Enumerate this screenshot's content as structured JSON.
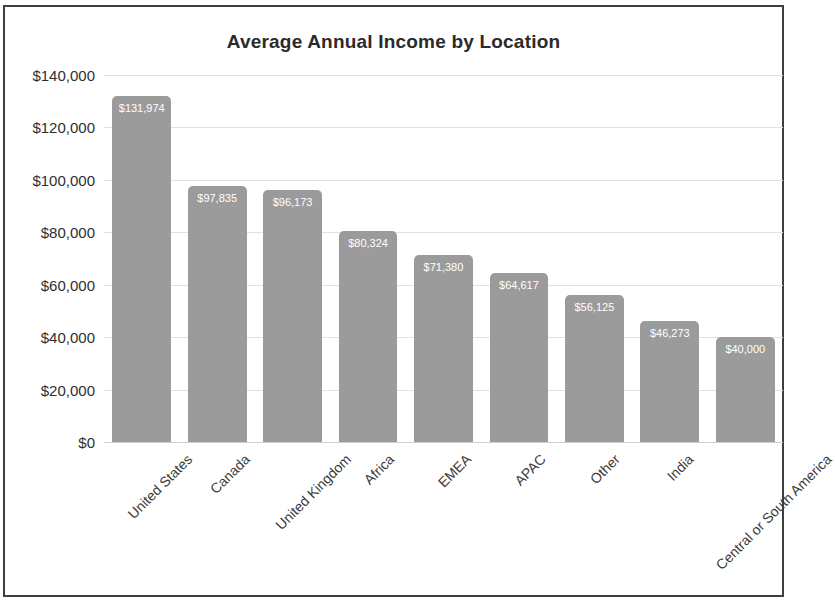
{
  "chart_data": {
    "type": "bar",
    "title": "Average Annual Income by Location",
    "xlabel": "",
    "ylabel": "",
    "ylim": [
      0,
      140000
    ],
    "grid": true,
    "legend": "none",
    "categories": [
      "United States",
      "Canada",
      "United Kingdom",
      "Africa",
      "EMEA",
      "APAC",
      "Other",
      "India",
      "Central or South America"
    ],
    "values": [
      131974,
      97835,
      96173,
      80324,
      71380,
      64617,
      56125,
      46273,
      40000
    ],
    "data_labels": [
      "$131,974",
      "$97,835",
      "$96,173",
      "$80,324",
      "$71,380",
      "$64,617",
      "$56,125",
      "$46,273",
      "$40,000"
    ],
    "y_ticks": [
      140000,
      120000,
      100000,
      80000,
      60000,
      40000,
      20000,
      0
    ],
    "y_tick_labels": [
      "$140,000",
      "$120,000",
      "$100,000",
      "$80,000",
      "$60,000",
      "$40,000",
      "$20,000",
      "$0"
    ],
    "colors": {
      "bar": "#9b9b9b",
      "data_label": "#ffffff",
      "gridline": "#e2e2e2",
      "title": "#2b2b2b",
      "tick_label": "#2f2f2f",
      "border": "#3f3f3f",
      "background": "#ffffff"
    }
  }
}
